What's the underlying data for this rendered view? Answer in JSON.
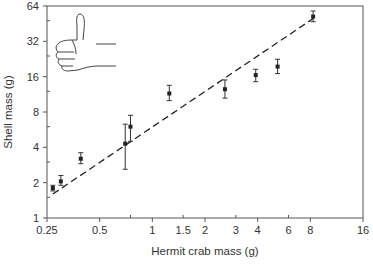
{
  "chart_data": {
    "type": "scatter",
    "title": "",
    "xlabel": "Hermit crab mass (g)",
    "ylabel": "Shell mass (g)",
    "xscale": "log2",
    "yscale": "log2",
    "xlim": [
      0.25,
      16
    ],
    "ylim": [
      1,
      64
    ],
    "xticks": [
      0.25,
      0.5,
      1,
      1.5,
      2,
      3,
      4,
      6,
      8,
      16
    ],
    "xtick_labels": [
      "0.25",
      "0.5",
      "1",
      "1.5",
      "2",
      "3",
      "4",
      "6",
      "8",
      "16"
    ],
    "yticks": [
      1,
      2,
      4,
      8,
      16,
      32,
      64
    ],
    "ytick_labels": [
      "1",
      "2",
      "4",
      "8",
      "16",
      "32",
      "64"
    ],
    "grid": false,
    "legend": null,
    "series": [
      {
        "name": "Shell mass vs hermit crab mass",
        "marker": "square",
        "color": "#222222",
        "points": [
          {
            "x": 0.27,
            "y": 1.8,
            "ylow": 1.7,
            "yhigh": 1.9
          },
          {
            "x": 0.3,
            "y": 2.05,
            "ylow": 1.9,
            "yhigh": 2.3
          },
          {
            "x": 0.39,
            "y": 3.2,
            "ylow": 2.9,
            "yhigh": 3.6
          },
          {
            "x": 0.7,
            "y": 4.3,
            "ylow": 2.6,
            "yhigh": 6.3
          },
          {
            "x": 0.75,
            "y": 6.0,
            "ylow": 4.5,
            "yhigh": 7.5
          },
          {
            "x": 1.25,
            "y": 11.5,
            "ylow": 10.0,
            "yhigh": 13.5
          },
          {
            "x": 2.6,
            "y": 12.5,
            "ylow": 10.5,
            "yhigh": 15.0
          },
          {
            "x": 3.9,
            "y": 16.5,
            "ylow": 14.5,
            "yhigh": 18.5
          },
          {
            "x": 5.2,
            "y": 19.5,
            "ylow": 17.0,
            "yhigh": 22.5
          },
          {
            "x": 8.3,
            "y": 52,
            "ylow": 47,
            "yhigh": 58
          }
        ]
      }
    ],
    "fit_line": {
      "style": "dashed",
      "color": "#222222",
      "from": {
        "x": 0.27,
        "y": 1.6
      },
      "to": {
        "x": 8.3,
        "y": 50
      }
    },
    "annotations": [
      {
        "type": "image",
        "description": "thumbs-up hand drawing",
        "position": "top-left"
      }
    ]
  }
}
